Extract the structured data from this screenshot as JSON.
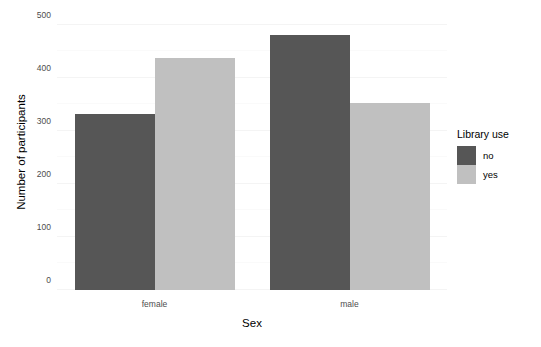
{
  "chart_data": {
    "type": "bar",
    "title": "",
    "xlabel": "Sex",
    "ylabel": "Number of participants",
    "categories": [
      "female",
      "male"
    ],
    "series": [
      {
        "name": "no",
        "values": [
          332,
          481
        ],
        "color": "#565656"
      },
      {
        "name": "yes",
        "values": [
          437,
          353
        ],
        "color": "#c0c0c0"
      }
    ],
    "legend": {
      "title": "Library use",
      "position": "right",
      "entries": [
        {
          "label": "no",
          "color": "#565656"
        },
        {
          "label": "yes",
          "color": "#c0c0c0"
        }
      ]
    },
    "yticks": [
      0,
      100,
      200,
      300,
      400,
      500
    ],
    "ytick_labels": [
      "0",
      "100",
      "200",
      "300",
      "400",
      "500"
    ],
    "ylim": [
      0,
      520
    ],
    "xtick_labels": [
      "female",
      "male"
    ],
    "grid": true,
    "grid_axis": "y",
    "bar_mode": "grouped"
  },
  "axes": {
    "y_title": "Number of participants",
    "x_title": "Sex"
  }
}
